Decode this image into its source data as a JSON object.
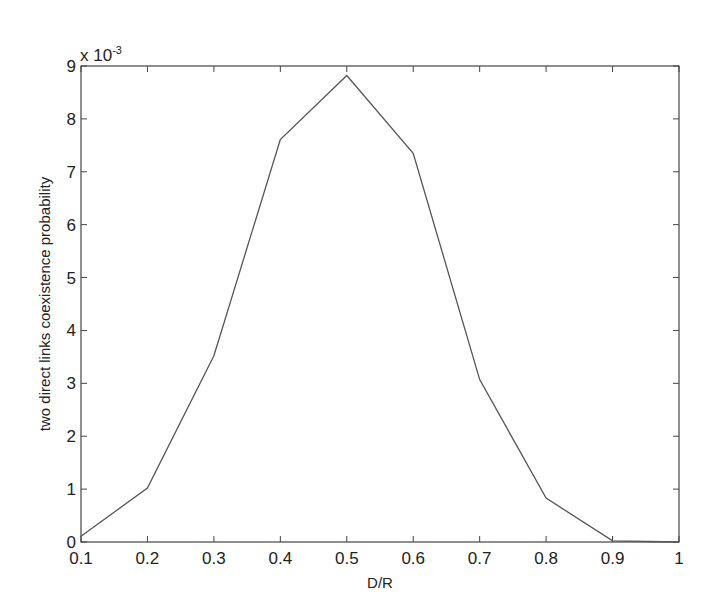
{
  "chart_data": {
    "type": "line",
    "title": "",
    "xlabel": "D/R",
    "ylabel": "two direct links coexistence probability",
    "y_multiplier_label": "x 10",
    "y_multiplier_exponent": "-3",
    "x": [
      0.1,
      0.2,
      0.3,
      0.4,
      0.5,
      0.6,
      0.7,
      0.8,
      0.9,
      1.0
    ],
    "series": [
      {
        "name": "coexistence probability",
        "color": "#555555",
        "values": [
          0.11,
          1.02,
          3.52,
          7.61,
          8.82,
          7.35,
          3.07,
          0.83,
          0.02,
          0.0
        ]
      }
    ],
    "xlim": [
      0.1,
      1.0
    ],
    "ylim": [
      0,
      9
    ],
    "x_ticks": [
      "0.1",
      "0.2",
      "0.3",
      "0.4",
      "0.5",
      "0.6",
      "0.7",
      "0.8",
      "0.9",
      "1"
    ],
    "y_ticks": [
      "0",
      "1",
      "2",
      "3",
      "4",
      "5",
      "6",
      "7",
      "8",
      "9"
    ],
    "grid": false,
    "legend": null
  }
}
